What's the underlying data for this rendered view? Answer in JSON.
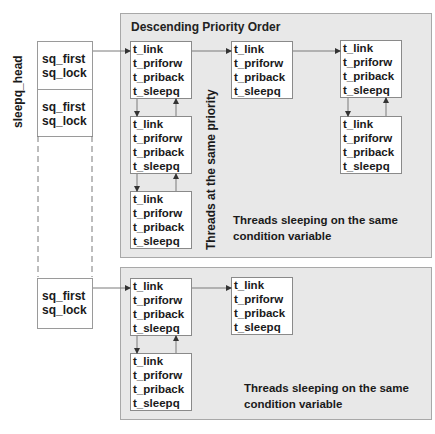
{
  "sleepq_head": {
    "label": "sleepq_head",
    "entries": [
      {
        "first": "sq_first",
        "lock": "sq_lock"
      },
      {
        "first": "sq_first",
        "lock": "sq_lock"
      },
      {
        "first": "sq_first",
        "lock": "sq_lock"
      }
    ]
  },
  "top_panel": {
    "title": "Descending Priority Order",
    "vertical_label": "Threads at  the same priority",
    "note": "Threads sleeping on the same condition variable"
  },
  "bottom_panel": {
    "note": "Threads sleeping on the same condition variable"
  },
  "thread_fields": [
    "t_link",
    "t_priforw",
    "t_priback",
    "t_sleepq"
  ],
  "threads": {
    "top_row_1": [
      "t_link",
      "t_priforw",
      "t_priback",
      "t_sleepq"
    ],
    "top_row_2": [
      "t_link",
      "t_priforw",
      "t_priback",
      "t_sleepq"
    ],
    "top_row_3": [
      "t_link",
      "t_priforw",
      "t_priback",
      "t_sleepq"
    ],
    "top_col1_2": [
      "t_link",
      "t_priforw",
      "t_priback",
      "t_sleepq"
    ],
    "top_col1_3": [
      "t_link",
      "t_priforw",
      "t_priback",
      "t_sleepq"
    ],
    "top_col3_2": [
      "t_link",
      "t_priforw",
      "t_priback",
      "t_sleepq"
    ],
    "bottom_row_1": [
      "t_link",
      "t_priforw",
      "t_priback",
      "t_sleepq"
    ],
    "bottom_row_2": [
      "t_link",
      "t_priforw",
      "t_priback",
      "t_sleepq"
    ],
    "bottom_col1_2": [
      "t_link",
      "t_priforw",
      "t_priback",
      "t_sleepq"
    ]
  },
  "colors": {
    "panel_fill": "#e8e8e8",
    "panel_border": "#a8a8a8",
    "box_fill": "#ffffff",
    "line": "#7a7a7a"
  }
}
